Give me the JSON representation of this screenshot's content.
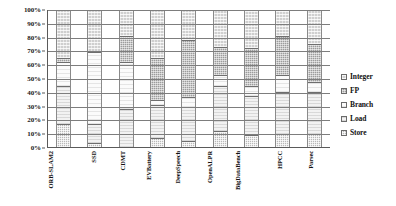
{
  "chart_data": {
    "type": "bar",
    "title": "",
    "subtitle": "",
    "xlabel": "",
    "ylabel": "",
    "stacked": true,
    "grid": true,
    "legend_position": "right",
    "ylim": [
      0,
      100
    ],
    "ytick_labels": [
      "100%",
      "90%",
      "80%",
      "70%",
      "60%",
      "50%",
      "40%",
      "30%",
      "20%",
      "10%",
      "0%"
    ],
    "ytick_values": [
      100,
      90,
      80,
      70,
      60,
      50,
      40,
      30,
      20,
      10,
      0
    ],
    "categories": [
      "ORB-SLAM2",
      "SSD",
      "CDMT",
      "EVBattery",
      "DeepSpeech",
      "OpenALPR",
      "BigDataBench",
      "HPCC",
      "Parsec"
    ],
    "series": [
      {
        "name": "Store",
        "values": [
          16,
          2,
          0,
          6,
          4,
          11,
          8,
          9,
          9
        ]
      },
      {
        "name": "Load",
        "values": [
          28,
          14,
          27,
          24,
          25,
          33,
          29,
          31,
          31
        ]
      },
      {
        "name": "Branch",
        "values": [
          18,
          53,
          35,
          4,
          7,
          8,
          7,
          12,
          7
        ]
      },
      {
        "name": "FP",
        "values": [
          3,
          0,
          19,
          31,
          42,
          21,
          28,
          29,
          28
        ]
      },
      {
        "name": "Integer",
        "values": [
          35,
          31,
          19,
          35,
          22,
          27,
          28,
          19,
          25
        ]
      }
    ],
    "legend": [
      {
        "label": "Integer",
        "key": "integer"
      },
      {
        "label": "FP",
        "key": "fp"
      },
      {
        "label": "Branch",
        "key": "branch"
      },
      {
        "label": "Load",
        "key": "load"
      },
      {
        "label": "Store",
        "key": "store"
      }
    ],
    "colors": {
      "integer": "#cfcfcf",
      "fp": "#9c9c9c",
      "branch": "#fbfbfb",
      "load": "#f2f2f2",
      "store": "#b9b9b9",
      "axis": "#5a5a5a",
      "grid": "#7d7d7d",
      "text": "#111111",
      "background": "#ffffff"
    }
  }
}
